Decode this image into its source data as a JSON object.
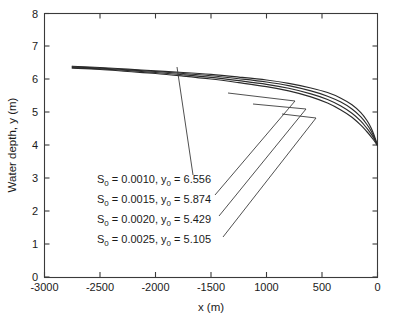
{
  "chart_data": {
    "type": "line",
    "title": "",
    "xlabel": "x (m)",
    "ylabel": "Water depth, y (m)",
    "xlim": [
      -3000,
      0
    ],
    "ylim": [
      0,
      8
    ],
    "xticks": [
      -3000,
      -2500,
      -2000,
      -1500,
      -1000,
      -500,
      0
    ],
    "xtick_labels": [
      "-3000",
      "-2500",
      "-2000",
      "-1500",
      "1000",
      "500",
      "0"
    ],
    "yticks": [
      0,
      1,
      2,
      3,
      4,
      5,
      6,
      7,
      8
    ],
    "ytick_labels": [
      "0",
      "1",
      "2",
      "3",
      "4",
      "5",
      "6",
      "7",
      "8"
    ],
    "grid": false,
    "legend_position": "none",
    "series": [
      {
        "name": "S0 = 0.0010",
        "slope": 0.001,
        "y0": 6.556,
        "points": [
          [
            -2750,
            6.4
          ],
          [
            -2500,
            6.36
          ],
          [
            -2250,
            6.31
          ],
          [
            -2000,
            6.26
          ],
          [
            -1750,
            6.21
          ],
          [
            -1500,
            6.15
          ],
          [
            -1250,
            6.07
          ],
          [
            -1000,
            5.98
          ],
          [
            -800,
            5.88
          ],
          [
            -600,
            5.74
          ],
          [
            -450,
            5.6
          ],
          [
            -330,
            5.43
          ],
          [
            -230,
            5.23
          ],
          [
            -150,
            4.99
          ],
          [
            -95,
            4.75
          ],
          [
            -55,
            4.51
          ],
          [
            -28,
            4.28
          ],
          [
            -12,
            4.12
          ],
          [
            0,
            4.0
          ]
        ]
      },
      {
        "name": "S0 = 0.0015",
        "slope": 0.0015,
        "y0": 5.874,
        "points": [
          [
            -2750,
            6.38
          ],
          [
            -2500,
            6.34
          ],
          [
            -2250,
            6.29
          ],
          [
            -2000,
            6.24
          ],
          [
            -1750,
            6.18
          ],
          [
            -1500,
            6.11
          ],
          [
            -1250,
            6.02
          ],
          [
            -1000,
            5.92
          ],
          [
            -800,
            5.81
          ],
          [
            -600,
            5.65
          ],
          [
            -450,
            5.49
          ],
          [
            -330,
            5.31
          ],
          [
            -230,
            5.1
          ],
          [
            -150,
            4.86
          ],
          [
            -95,
            4.63
          ],
          [
            -55,
            4.42
          ],
          [
            -28,
            4.23
          ],
          [
            -12,
            4.1
          ],
          [
            0,
            4.0
          ]
        ]
      },
      {
        "name": "S0 = 0.0020",
        "slope": 0.002,
        "y0": 5.429,
        "points": [
          [
            -2750,
            6.36
          ],
          [
            -2500,
            6.32
          ],
          [
            -2250,
            6.27
          ],
          [
            -2000,
            6.21
          ],
          [
            -1750,
            6.14
          ],
          [
            -1500,
            6.06
          ],
          [
            -1250,
            5.96
          ],
          [
            -1000,
            5.85
          ],
          [
            -800,
            5.73
          ],
          [
            -600,
            5.56
          ],
          [
            -450,
            5.39
          ],
          [
            -330,
            5.19
          ],
          [
            -230,
            4.97
          ],
          [
            -150,
            4.73
          ],
          [
            -95,
            4.51
          ],
          [
            -55,
            4.33
          ],
          [
            -28,
            4.18
          ],
          [
            -12,
            4.08
          ],
          [
            0,
            4.0
          ]
        ]
      },
      {
        "name": "S0 = 0.0025",
        "slope": 0.0025,
        "y0": 5.105,
        "points": [
          [
            -2750,
            6.34
          ],
          [
            -2500,
            6.3
          ],
          [
            -2250,
            6.24
          ],
          [
            -2000,
            6.18
          ],
          [
            -1750,
            6.1
          ],
          [
            -1500,
            6.01
          ],
          [
            -1250,
            5.9
          ],
          [
            -1000,
            5.78
          ],
          [
            -800,
            5.65
          ],
          [
            -600,
            5.47
          ],
          [
            -450,
            5.28
          ],
          [
            -330,
            5.07
          ],
          [
            -230,
            4.85
          ],
          [
            -150,
            4.61
          ],
          [
            -95,
            4.41
          ],
          [
            -55,
            4.25
          ],
          [
            -28,
            4.13
          ],
          [
            -12,
            4.05
          ],
          [
            0,
            4.0
          ]
        ]
      }
    ],
    "annotations": [
      {
        "id": "annot-slope-1",
        "prefix": "S",
        "sub1": "0",
        "mid": " = 0.0010, y",
        "sub2": "0",
        "suffix": " = 6.556"
      },
      {
        "id": "annot-slope-2",
        "prefix": "S",
        "sub1": "0",
        "mid": " = 0.0015, y",
        "sub2": "0",
        "suffix": " = 5.874"
      },
      {
        "id": "annot-slope-3",
        "prefix": "S",
        "sub1": "0",
        "mid": " = 0.0020, y",
        "sub2": "0",
        "suffix": " = 5.429"
      },
      {
        "id": "annot-slope-4",
        "prefix": "S",
        "sub1": "0",
        "mid": " = 0.0025, y",
        "sub2": "0",
        "suffix": " = 5.105"
      }
    ],
    "colors": {
      "curve": "#2b2b2b",
      "axis": "#3a3a3a",
      "text": "#1a1a1a",
      "background": "#ffffff"
    }
  }
}
